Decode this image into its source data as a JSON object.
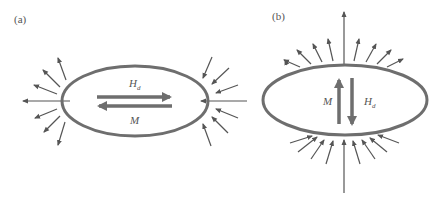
{
  "diagram": {
    "colors": {
      "outline": "#6e6e6e",
      "arrow": "#555555",
      "text": "#555555",
      "background": "#ffffff"
    },
    "panels": [
      {
        "id": "a",
        "label": "(a)",
        "description": "Horizontally elongated ellipse magnetized along long axis",
        "magnetization_label": "M",
        "field_label_main": "H",
        "field_label_sub": "d",
        "magnetization_direction": "left",
        "demag_field_direction": "right",
        "external_field_arrows": "outgoing-left, incoming-right"
      },
      {
        "id": "b",
        "label": "(b)",
        "description": "Ellipse magnetized along short axis",
        "magnetization_label": "M",
        "field_label_main": "H",
        "field_label_sub": "d",
        "magnetization_direction": "up",
        "demag_field_direction": "down",
        "external_field_arrows": "outgoing-top, incoming-bottom"
      }
    ]
  }
}
